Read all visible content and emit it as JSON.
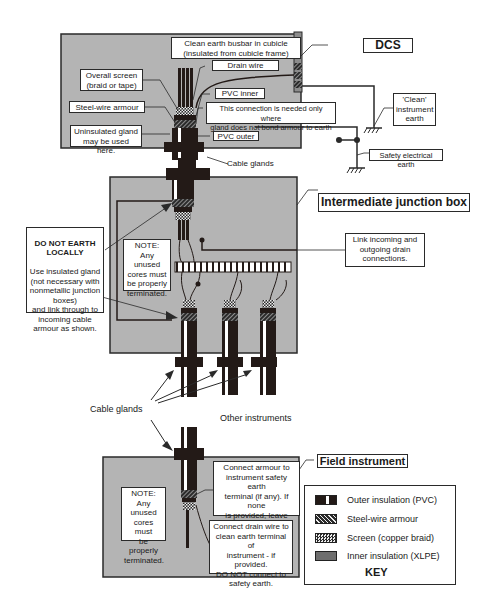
{
  "diagram": {
    "sections": {
      "dcs": {
        "title": "DCS"
      },
      "junction_box": {
        "title": "Intermediate junction box"
      },
      "field": {
        "title": "Field instrument"
      }
    },
    "dcs_labels": {
      "busbar": "Clean earth busbar in cubicle\n(insulated from cubicle frame)",
      "drain_wire": "Drain wire",
      "overall_screen": "Overall screen\n(braid or tape)",
      "pvc_inner": "PVC inner",
      "steel_wire_armour": "Steel-wire armour",
      "connection_note": "This connection is needed only where\ngland does not bond armour to earth",
      "uninsulated_gland": "Uninsulated gland\nmay be used here.",
      "pvc_outer": "PVC outer",
      "clean_earth": "'Clean'\ninstrument\nearth",
      "safety_earth": "Safety electrical earth",
      "cable_glands": "Cable glands"
    },
    "junction_labels": {
      "do_not_earth_head": "DO NOT EARTH\nLOCALLY",
      "do_not_earth_body": "Use insulated gland\n(not necessary with\nnonmetallic junction\nboxes)\nand link through to\nincoming cable\narmour as shown.",
      "note": "NOTE:\nAny unused\ncores must\nbe properly\nterminated.",
      "link_drain": "Link incoming and\noutgoing drain\nconnections."
    },
    "between_labels": {
      "cable_glands": "Cable glands",
      "other_instruments": "Other instruments"
    },
    "field_labels": {
      "note": "NOTE:\nAny unused\ncores must\nbe properly\nterminated.",
      "connect_armour": "Connect armour to\ninstrument safety earth\nterminal (if any). If none\nis provided, leave\nunconnected.",
      "connect_drain": "Connect drain wire to\nclean earth terminal of\ninstrument - if provided.\nDO NOT connect to\nsafety earth."
    },
    "key": {
      "title": "KEY",
      "items": [
        {
          "label": "Outer insulation (PVC)",
          "swatch": "outer-pvc"
        },
        {
          "label": "Steel-wire armour",
          "swatch": "armour"
        },
        {
          "label": "Screen (copper braid)",
          "swatch": "screen"
        },
        {
          "label": "Inner insulation (XLPE)",
          "swatch": "inner-xlpe"
        }
      ]
    },
    "colors": {
      "box_fill": "#b4b4b4",
      "cable_dark": "#231a17",
      "line": "#2a2a2a",
      "label_bg": "#ffffff"
    }
  }
}
